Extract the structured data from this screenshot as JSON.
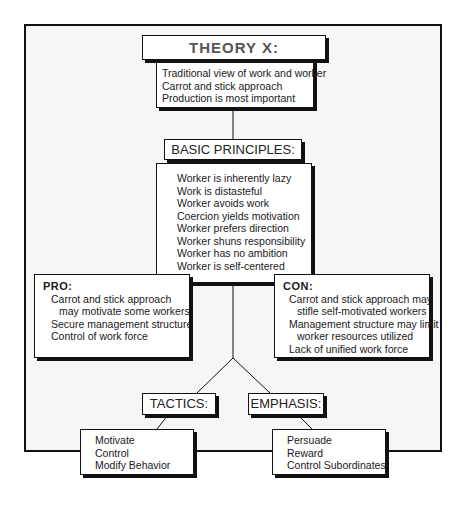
{
  "title_box": {
    "title": "THEORY X:",
    "items": [
      "Traditional view of work and worker",
      "Carrot and stick approach",
      "Production is most important"
    ]
  },
  "principles": {
    "title": "BASIC PRINCIPLES:",
    "items": [
      "Worker is inherently lazy",
      "Work is distasteful",
      "Worker avoids work",
      "Coercion yields motivation",
      "Worker prefers direction",
      "Worker shuns responsibility",
      "Worker has no ambition",
      "Worker is self-centered"
    ]
  },
  "pro": {
    "title": "PRO:",
    "items": [
      "Carrot and stick approach",
      "may motivate some workers",
      "Secure management structure",
      "Control of work force"
    ]
  },
  "con": {
    "title": "CON:",
    "items": [
      "Carrot and stick approach may",
      "stifle self-motivated workers",
      "Management structure may limit",
      "worker resources utilized",
      "Lack of unified work force"
    ]
  },
  "tactics": {
    "title": "TACTICS:",
    "items": [
      "Motivate",
      "Control",
      "Modify Behavior"
    ]
  },
  "emphasis": {
    "title": "EMPHASIS:",
    "items": [
      "Persuade",
      "Reward",
      "Control Subordinates"
    ]
  }
}
